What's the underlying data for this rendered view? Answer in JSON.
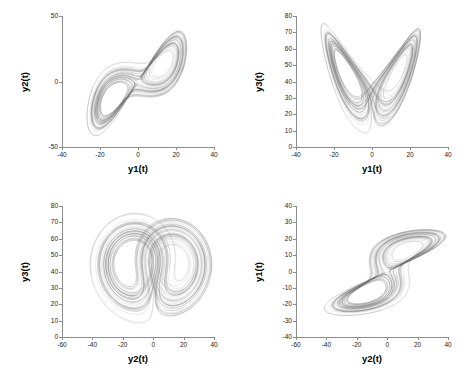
{
  "figure": {
    "background": "#ffffff",
    "line_color": "#6e6e6e",
    "axis_color": "#8c8c8c",
    "width": 467,
    "height": 379,
    "layout": "2x2 grid of phase-space projections"
  },
  "chart_data": [
    {
      "id": "panel-y1-y2",
      "type": "line",
      "title": "",
      "xlabel": "y1(t)",
      "ylabel": "y2(t)",
      "xlim": [
        -40,
        40
      ],
      "ylim": [
        -50,
        50
      ],
      "xticks": [
        -40,
        -20,
        0,
        20,
        40
      ],
      "xticklabels": [
        "-40",
        "-20",
        "0",
        "20",
        "40"
      ],
      "yticks": [
        -50,
        0,
        50
      ],
      "yticklabels": [
        "-50",
        "0",
        "50"
      ],
      "grid": false,
      "legend": null,
      "description": "Lorenz attractor projection onto y1-y2 plane: elongated diagonal band of nested loops running lower-left to upper-right",
      "series": [
        {
          "name": "trajectory",
          "color": "#6e6e6e",
          "shape": "diagonal-band",
          "x_extent": [
            -33,
            33
          ],
          "y_extent": [
            -38,
            38
          ],
          "lobe_centers": [
            [
              -14,
              -17
            ],
            [
              14,
              17
            ]
          ]
        }
      ]
    },
    {
      "id": "panel-y1-y3",
      "type": "line",
      "title": "",
      "xlabel": "y1(t)",
      "ylabel": "y3(t)",
      "xlim": [
        -40,
        40
      ],
      "ylim": [
        0,
        80
      ],
      "xticks": [
        -40,
        -20,
        0,
        20,
        40
      ],
      "xticklabels": [
        "-40",
        "-20",
        "0",
        "20",
        "40"
      ],
      "yticks": [
        0,
        10,
        20,
        30,
        40,
        50,
        60,
        70,
        80
      ],
      "yticklabels": [
        "0",
        "10",
        "20",
        "30",
        "40",
        "50",
        "60",
        "70",
        "80"
      ],
      "grid": false,
      "legend": null,
      "description": "Lorenz attractor projection onto y1-y3 plane: classic butterfly with two wings meeting at a central notch near x=0",
      "series": [
        {
          "name": "trajectory",
          "color": "#6e6e6e",
          "shape": "butterfly",
          "x_extent": [
            -32,
            32
          ],
          "y_extent": [
            8,
            68
          ],
          "lobe_centers": [
            [
              -12,
              38
            ],
            [
              12,
              38
            ]
          ]
        }
      ]
    },
    {
      "id": "panel-y2-y3",
      "type": "line",
      "title": "",
      "xlabel": "y2(t)",
      "ylabel": "y3(t)",
      "xlim": [
        -60,
        40
      ],
      "ylim": [
        0,
        80
      ],
      "xticks": [
        -60,
        -40,
        -20,
        0,
        20,
        40
      ],
      "xticklabels": [
        "-60",
        "-40",
        "-20",
        "0",
        "20",
        "40"
      ],
      "yticks": [
        0,
        10,
        20,
        30,
        40,
        50,
        60,
        70,
        80
      ],
      "yticklabels": [
        "0",
        "10",
        "20",
        "30",
        "40",
        "50",
        "60",
        "70",
        "80"
      ],
      "grid": false,
      "legend": null,
      "description": "Lorenz attractor projection onto y2-y3 plane: broad double-lobed butterfly, wings nearly horizontal with spiral centers",
      "series": [
        {
          "name": "trajectory",
          "color": "#6e6e6e",
          "shape": "double-lobe",
          "x_extent": [
            -40,
            38
          ],
          "y_extent": [
            8,
            66
          ],
          "lobe_centers": [
            [
              -14,
              36
            ],
            [
              13,
              36
            ]
          ]
        }
      ]
    },
    {
      "id": "panel-y2-y1",
      "type": "line",
      "title": "",
      "xlabel": "y2(t)",
      "ylabel": "y1(t)",
      "xlim": [
        -60,
        40
      ],
      "ylim": [
        -40,
        40
      ],
      "xticks": [
        -60,
        -40,
        -20,
        0,
        20,
        40
      ],
      "xticklabels": [
        "-60",
        "-40",
        "-20",
        "0",
        "20",
        "40"
      ],
      "yticks": [
        -40,
        -30,
        -20,
        -10,
        0,
        10,
        20,
        30,
        40
      ],
      "yticklabels": [
        "-40",
        "-30",
        "-20",
        "-10",
        "0",
        "10",
        "20",
        "30",
        "40"
      ],
      "grid": false,
      "legend": null,
      "description": "Lorenz attractor projection onto y2-y1 plane: elongated diagonal band of nested loops running lower-left to upper-right",
      "series": [
        {
          "name": "trajectory",
          "color": "#6e6e6e",
          "shape": "diagonal-band",
          "x_extent": [
            -38,
            36
          ],
          "y_extent": [
            -33,
            30
          ],
          "lobe_centers": [
            [
              -16,
              -14
            ],
            [
              14,
              15
            ]
          ]
        }
      ]
    }
  ]
}
